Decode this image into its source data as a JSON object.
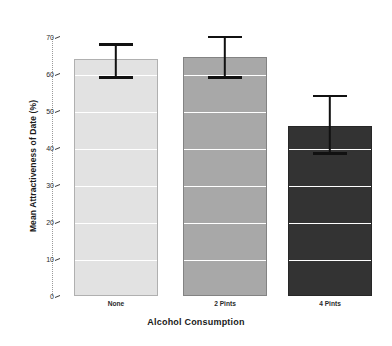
{
  "chart_data": {
    "type": "bar",
    "title": "",
    "xlabel": "Alcohol Consumption",
    "ylabel": "Mean Attractiveness of Date (%)",
    "categories": [
      "None",
      "2 Pints",
      "4 Pints"
    ],
    "values": [
      64,
      64.5,
      46
    ],
    "errors_low": [
      59,
      59,
      38.5
    ],
    "errors_high": [
      68,
      70,
      54
    ],
    "ylim": [
      0,
      70
    ],
    "ytick_labels": [
      "0",
      "10",
      "20",
      "30",
      "40",
      "50",
      "60",
      "70"
    ],
    "ytick_values": [
      0,
      10,
      20,
      30,
      40,
      50,
      60,
      70
    ],
    "grid": "white horizontal gridlines drawn across bars at each 10-unit tick",
    "legend": "none",
    "bar_colors": [
      "#e2e2e2",
      "#a8a8a8",
      "#333333"
    ],
    "error_bar_color": "#111111",
    "axis_color": "#9a9a9a"
  },
  "axes": {
    "y_title": "Mean Attractiveness of Date (%)",
    "x_title": "Alcohol Consumption"
  }
}
